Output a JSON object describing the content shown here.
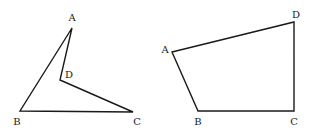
{
  "figures": [
    {
      "name": "concave-quadrilateral",
      "stroke_color": "#1a1a1a",
      "vertices": [
        {
          "label": "A",
          "x": 72,
          "y": 28,
          "label_x": 72,
          "label_y": 18
        },
        {
          "label": "D",
          "x": 60,
          "y": 80,
          "label_x": 69,
          "label_y": 75
        },
        {
          "label": "C",
          "x": 133,
          "y": 112,
          "label_x": 137,
          "label_y": 122
        },
        {
          "label": "B",
          "x": 20,
          "y": 111,
          "label_x": 17,
          "label_y": 122
        }
      ]
    },
    {
      "name": "convex-quadrilateral",
      "stroke_color": "#1a1a1a",
      "vertices": [
        {
          "label": "A",
          "x": 172,
          "y": 52,
          "label_x": 165,
          "label_y": 50
        },
        {
          "label": "D",
          "x": 294,
          "y": 22,
          "label_x": 296,
          "label_y": 15
        },
        {
          "label": "C",
          "x": 294,
          "y": 111,
          "label_x": 294,
          "label_y": 122
        },
        {
          "label": "B",
          "x": 198,
          "y": 111,
          "label_x": 198,
          "label_y": 122
        }
      ]
    }
  ]
}
